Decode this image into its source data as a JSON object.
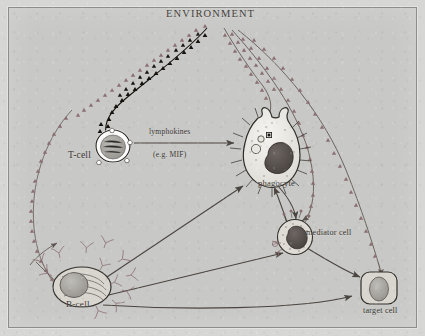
{
  "figure": {
    "title": "ENVIRONMENT",
    "background_color": "#c8c8c6",
    "frame_color": "#8d8d8b",
    "ink_color": "#4a4540",
    "antigen_dark_color": "#1d1a17",
    "antigen_light_color": "#8a6f72"
  },
  "labels": {
    "environment": "ENVIRONMENT",
    "t_cell": "T-cell",
    "lymphokines": "lymphokines",
    "mif": "(e.g. MIF)",
    "phagocyte": "phagocyte",
    "mediator_cell": "mediator cell",
    "b_cell": "B-cell",
    "target_cell": "target cell"
  },
  "cells": [
    {
      "name": "t-cell",
      "label": "T-cell",
      "shape": "round lymphocyte with bright halo and large nucleus"
    },
    {
      "name": "phagocyte",
      "label": "phagocyte",
      "shape": "amoeboid macrophage with radiating spikes, vacuoles and dark kidney nucleus"
    },
    {
      "name": "mediator-cell",
      "label": "mediator cell",
      "shape": "granular round cell with surface receptors and dark nucleus"
    },
    {
      "name": "b-cell",
      "label": "B-cell",
      "shape": "layered plasma cell shedding Y-shaped antibodies"
    },
    {
      "name": "target-cell",
      "label": "target cell",
      "shape": "rounded rectangular cell with oval nucleus"
    }
  ],
  "connections": [
    {
      "from": "environment",
      "to": "t-cell",
      "style": "antigen-trail-dark",
      "note": "antigen particles reaching the T-cell"
    },
    {
      "from": "environment",
      "to": "t-cell",
      "style": "antigen-trail-light"
    },
    {
      "from": "environment",
      "to": "phagocyte",
      "style": "antigen-trail-light"
    },
    {
      "from": "environment",
      "to": "mediator-cell",
      "style": "antigen-trail-light"
    },
    {
      "from": "environment",
      "to": "target-cell",
      "style": "antigen-trail-light"
    },
    {
      "from": "environment",
      "to": "b-cell",
      "style": "antigen-trail-light"
    },
    {
      "from": "t-cell",
      "to": "phagocyte",
      "style": "arrow",
      "label": "lymphokines (e.g. MIF)"
    },
    {
      "from": "b-cell",
      "to": "phagocyte",
      "style": "arrow"
    },
    {
      "from": "b-cell",
      "to": "mediator-cell",
      "style": "arrow"
    },
    {
      "from": "b-cell",
      "to": "target-cell",
      "style": "arrow"
    },
    {
      "from": "phagocyte",
      "to": "mediator-cell",
      "style": "arrow"
    },
    {
      "from": "mediator-cell",
      "to": "phagocyte",
      "style": "arrow"
    },
    {
      "from": "mediator-cell",
      "to": "target-cell",
      "style": "arrow"
    }
  ]
}
